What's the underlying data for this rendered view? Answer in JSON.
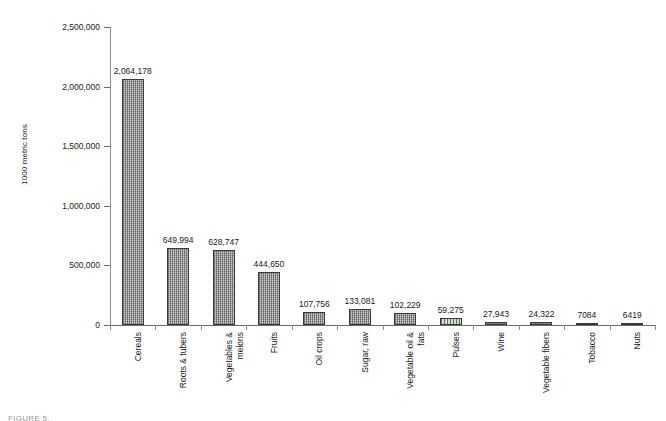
{
  "chart_data": {
    "type": "bar",
    "title": "",
    "subtitle": "",
    "xlabel": "",
    "ylabel": "1000 metric tons",
    "ylim": [
      0,
      2500000
    ],
    "ytick_labels": [
      "2,500,000",
      "2,000,000",
      "1,500,000",
      "1,000,000",
      "500,000",
      "0"
    ],
    "ytick_values": [
      2500000,
      2000000,
      1500000,
      1000000,
      500000,
      0
    ],
    "grid": false,
    "legend": null,
    "categories": [
      "Cereals",
      "Roots & tubers",
      "Vegetables & melons",
      "Fruits",
      "Oil crops",
      "Sugar, raw",
      "Vegetable oil & fats",
      "Pulses",
      "Wine",
      "Vegetable fibers",
      "Tobacco",
      "Nuts"
    ],
    "category_lines": [
      [
        "Cereals"
      ],
      [
        "Roots & tubers"
      ],
      [
        "Vegetables &",
        "melons"
      ],
      [
        "Fruits"
      ],
      [
        "Oil crops"
      ],
      [
        "Sugar, raw"
      ],
      [
        "Vegetable oil &",
        "fats"
      ],
      [
        "Pulses"
      ],
      [
        "Wine"
      ],
      [
        "Vegetable fibers"
      ],
      [
        "Tobacco"
      ],
      [
        "Nuts"
      ]
    ],
    "values": [
      2064178,
      649994,
      628747,
      444650,
      107756,
      133081,
      102229,
      59275,
      27943,
      24322,
      7084,
      6419
    ],
    "value_labels": [
      "2,064,178",
      "649,994",
      "628,747",
      "444,650",
      "107,756",
      "133,081",
      "102,229",
      "59,275",
      "27,943",
      "24,322",
      "7084",
      "6419"
    ],
    "bar_styles": [
      "dotted-gray",
      "dotted-gray",
      "dotted-gray",
      "dotted-gray",
      "dotted-gray",
      "dotted-gray",
      "dotted-gray",
      "striped-green",
      "dotted-gray",
      "dotted-gray",
      "dotted-gray",
      "dotted-gray"
    ],
    "colors": {
      "bar_fill": "#d2d2d2",
      "bar_border": "#3a3a3a",
      "bar_fill_accent": "#cfdccf",
      "axis": "#6b6b6b",
      "text": "#1a1a1a",
      "background": "#ffffff"
    }
  },
  "footer": {
    "scrap_text": "FIGURE 5."
  }
}
